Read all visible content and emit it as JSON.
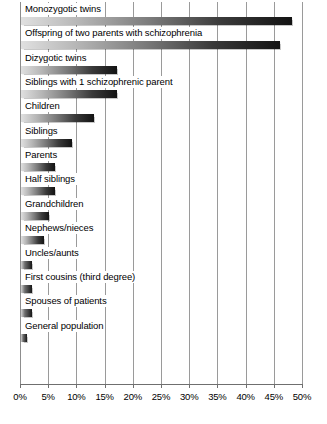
{
  "chart_data": {
    "type": "bar",
    "orientation": "horizontal",
    "title": "",
    "subtitle": "",
    "xlabel": "",
    "ylabel": "",
    "xlim": [
      0,
      50
    ],
    "grid": true,
    "legend": null,
    "tick_labels": [
      "0%",
      "5%",
      "10%",
      "15%",
      "20%",
      "25%",
      "30%",
      "35%",
      "40%",
      "45%",
      "50%"
    ],
    "tick_values": [
      0,
      5,
      10,
      15,
      20,
      25,
      30,
      35,
      40,
      45,
      50
    ],
    "categories": [
      "Monozygotic twins",
      "Offspring of two parents with schizophrenia",
      "Dizygotic twins",
      "Siblings with 1 schizophrenic parent",
      "Children",
      "Siblings",
      "Parents",
      "Half siblings",
      "Grandchildren",
      "Nephews/nieces",
      "Uncles/aunts",
      "First cousins (third degree)",
      "Spouses of patients",
      "General population"
    ],
    "values": [
      48,
      46,
      17,
      17,
      13,
      9,
      6,
      6,
      5,
      4,
      2,
      2,
      2,
      1
    ],
    "unit": "%",
    "bar_fill": "gradient-lightgray-to-black",
    "colors": {
      "bar_gradient_start": "#e0e0e0",
      "bar_gradient_end": "#131313",
      "gridline": "#9a9a9a",
      "axis": "#6f6f6f",
      "text": "#000000",
      "background": "#ffffff"
    }
  }
}
